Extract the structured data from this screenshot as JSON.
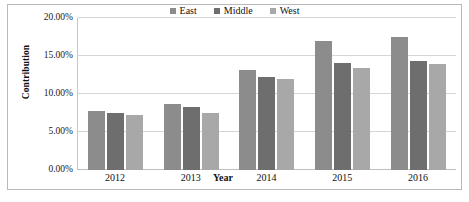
{
  "chart_data": {
    "type": "bar",
    "title": "",
    "subtitle": "",
    "xlabel": "Year",
    "ylabel": "Contribution",
    "categories": [
      "2012",
      "2013",
      "2014",
      "2015",
      "2016"
    ],
    "series": [
      {
        "name": "East",
        "color": "#8c8c8c",
        "values": [
          7.7,
          8.7,
          13.2,
          17.0,
          17.5
        ]
      },
      {
        "name": "Middle",
        "color": "#6e6e6e",
        "values": [
          7.5,
          8.3,
          12.3,
          14.1,
          14.4
        ]
      },
      {
        "name": "West",
        "color": "#a8a8a8",
        "values": [
          7.3,
          7.5,
          12.0,
          13.4,
          14.0
        ]
      }
    ],
    "ylim": [
      0,
      20
    ],
    "ytick_values": [
      0,
      5,
      10,
      15,
      20
    ],
    "ytick_labels": [
      "0.00%",
      "5.00%",
      "10.00%",
      "15.00%",
      "20.00%"
    ],
    "yunit": "%",
    "grid": true,
    "legend_position": "top-center",
    "bar_grouping": "clustered"
  },
  "axes": {
    "y_title": "Contribution",
    "x_title": "Year"
  },
  "legend": {
    "entries": [
      {
        "label": "East"
      },
      {
        "label": "Middle"
      },
      {
        "label": "West"
      }
    ]
  },
  "colors": {
    "east": "#8c8c8c",
    "middle": "#6e6e6e",
    "west": "#a8a8a8",
    "gridline": "#d6d6d6",
    "border": "#b9b9b9",
    "text": "#111111",
    "background": "#ffffff"
  }
}
